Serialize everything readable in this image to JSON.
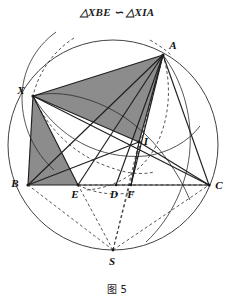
{
  "figure": {
    "title_statement": "△XBE ∽ △XIA",
    "caption": "图 5",
    "caption_number": "5"
  },
  "colors": {
    "stroke": "#2b2b2b",
    "shade_fill": "#8c8c8c",
    "background": "#ffffff",
    "label_color": "#111111"
  },
  "geometry": {
    "circumcircle": {
      "name": "circumcircle-ABC",
      "cx": 113,
      "cy": 123,
      "r": 105
    },
    "points": [
      {
        "id": "A",
        "label": "A",
        "x": 163,
        "y": 33,
        "lx": 173,
        "ly": 27
      },
      {
        "id": "X",
        "label": "X",
        "x": 33,
        "y": 74,
        "lx": 21,
        "ly": 72
      },
      {
        "id": "B",
        "label": "B",
        "x": 28,
        "y": 163,
        "lx": 15,
        "ly": 165
      },
      {
        "id": "C",
        "label": "C",
        "x": 209,
        "y": 163,
        "lx": 217,
        "ly": 167
      },
      {
        "id": "E",
        "label": "E",
        "x": 78,
        "y": 163,
        "lx": 74,
        "ly": 175
      },
      {
        "id": "D",
        "label": "D",
        "x": 116,
        "y": 163,
        "lx": 112,
        "ly": 175
      },
      {
        "id": "F",
        "label": "F",
        "x": 131,
        "y": 163,
        "lx": 128,
        "ly": 175
      },
      {
        "id": "I",
        "label": "I",
        "x": 139,
        "y": 120,
        "lx": 145,
        "ly": 120
      },
      {
        "id": "S",
        "label": "S",
        "x": 113,
        "y": 228,
        "lx": 110,
        "ly": 242
      }
    ],
    "solid_segments": [
      {
        "name": "segment-BC",
        "from": "B",
        "to": "C"
      },
      {
        "name": "segment-AB",
        "from": "A",
        "to": "B"
      },
      {
        "name": "segment-AC",
        "from": "A",
        "to": "C"
      },
      {
        "name": "segment-XA",
        "from": "X",
        "to": "A"
      },
      {
        "name": "segment-XB",
        "from": "X",
        "to": "B"
      },
      {
        "name": "segment-XC",
        "from": "X",
        "to": "C"
      },
      {
        "name": "segment-XE",
        "from": "X",
        "to": "E"
      },
      {
        "name": "segment-XI",
        "from": "X",
        "to": "I"
      },
      {
        "name": "segment-AI",
        "from": "A",
        "to": "I"
      },
      {
        "name": "segment-AE",
        "from": "A",
        "to": "E"
      },
      {
        "name": "segment-AD",
        "from": "A",
        "to": "D"
      },
      {
        "name": "segment-AF",
        "from": "A",
        "to": "F"
      },
      {
        "name": "segment-BI",
        "from": "B",
        "to": "I"
      },
      {
        "name": "segment-IC",
        "from": "I",
        "to": "C"
      },
      {
        "name": "segment-IF",
        "from": "I",
        "to": "F"
      }
    ],
    "dashed_segments": [
      {
        "name": "dashed-segment-SE",
        "from": "S",
        "to": "E"
      },
      {
        "name": "dashed-segment-SI",
        "from": "S",
        "to": "I"
      },
      {
        "name": "dashed-segment-SA",
        "from": "S",
        "to": "A"
      },
      {
        "name": "dashed-segment-SC",
        "from": "S",
        "to": "C"
      },
      {
        "name": "dashed-segment-SB",
        "from": "S",
        "to": "B"
      },
      {
        "name": "dashed-segment-EC",
        "from": "E",
        "to": "C"
      }
    ],
    "shaded_triangles": [
      {
        "name": "shaded-triangle-XIA",
        "vertices": [
          "X",
          "A",
          "I"
        ]
      },
      {
        "name": "shaded-triangle-XBE",
        "vertices": [
          "X",
          "B",
          "E"
        ]
      }
    ],
    "arcs": [
      {
        "name": "arc-solid-through-X-left",
        "d": "M 56 10 C 34 26 22 50 22 76 C 22 104 34 130 54 148",
        "dashed": false
      },
      {
        "name": "arc-solid-X-to-C",
        "d": "M 33 74 C 62 66 105 78 136 104 C 160 124 178 150 190 178",
        "dashed": false
      },
      {
        "name": "arc-solid-A-to-S",
        "d": "M 163 33 C 182 58 192 92 190 126 C 188 160 172 196 146 220",
        "dashed": false
      },
      {
        "name": "arc-solid-inner-BXA",
        "d": "M 33 74 C 58 116 100 138 146 134 C 168 131 188 120 200 104",
        "dashed": false
      },
      {
        "name": "arc-dashed-upper-left",
        "d": "M 74 16 C 52 30 38 52 33 74",
        "dashed": true
      },
      {
        "name": "arc-dashed-X-to-F",
        "d": "M 33 74 C 50 112 82 140 126 150 C 136 152 146 152 154 150",
        "dashed": true
      },
      {
        "name": "arc-dashed-A-to-E",
        "d": "M 163 33 C 172 62 170 96 156 124 C 142 150 116 166 86 168",
        "dashed": true
      },
      {
        "name": "arc-dashed-E-to-F-low",
        "d": "M 78 163 C 96 172 116 174 134 170",
        "dashed": true
      },
      {
        "name": "arc-dashed-top-right-small",
        "d": "M 150 18 C 160 24 166 28 172 34",
        "dashed": true
      }
    ]
  },
  "annotations": {
    "similarity_symbol": "∽",
    "triangle_symbol": "△",
    "left_triangle": "XBE",
    "right_triangle": "XIA"
  }
}
